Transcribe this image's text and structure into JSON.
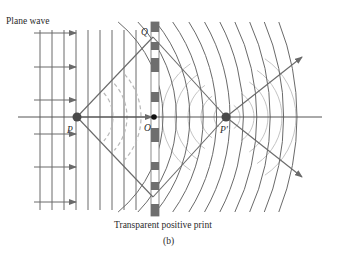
{
  "figure": {
    "caption": "(b)",
    "labels": {
      "plane_wave": "Plane wave",
      "print": "Transparent positive print"
    },
    "points": {
      "P": "P",
      "O": "O",
      "Q": "Q",
      "P_prime": "P′"
    },
    "colors": {
      "line": "#6a6a6a",
      "axis": "#555555",
      "dark_point": "#4a4a4a",
      "dashed": "#b8b8b8",
      "light_arc": "#c4c4c4",
      "print_dark": "#6e6e6e",
      "text": "#2a2a2a"
    },
    "geometry": {
      "axis_y": 117,
      "P": [
        77,
        117
      ],
      "O": [
        154,
        117
      ],
      "Q": [
        153,
        37
      ],
      "P_prime": [
        226,
        117
      ],
      "Q_lower": [
        153,
        197
      ],
      "print_x": [
        151,
        159
      ],
      "print_y": [
        22,
        216
      ],
      "plane_wave_x": [
        40,
        52,
        64,
        76,
        88,
        100,
        112,
        124,
        136
      ],
      "arrow_rows_y": [
        33,
        67,
        100,
        134,
        167,
        202
      ],
      "print_dark_blocks": [
        [
          22,
          32
        ],
        [
          42,
          50
        ],
        [
          58,
          72
        ],
        [
          92,
          102
        ],
        [
          128,
          142
        ],
        [
          162,
          170
        ],
        [
          182,
          190
        ],
        [
          204,
          216
        ]
      ]
    }
  }
}
